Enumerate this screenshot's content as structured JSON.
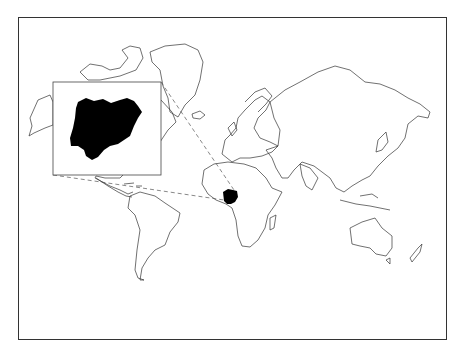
{
  "map": {
    "type": "world-locator-map",
    "projection": "Mercator",
    "highlighted_country": "Nigeria",
    "highlight_color": "#000000",
    "outline_color": "#333333",
    "background_color": "#ffffff",
    "inset": {
      "shows": "Nigeria",
      "fill": "#000000",
      "leader_lines": "dashed"
    }
  }
}
